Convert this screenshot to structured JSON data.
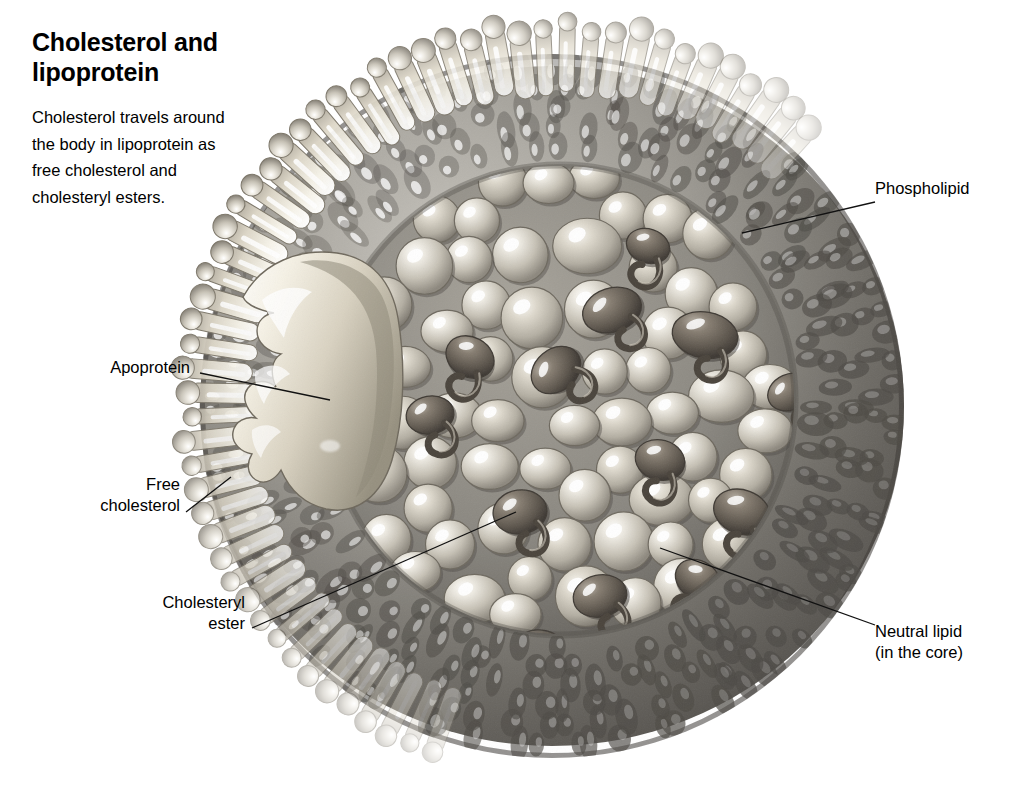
{
  "figure": {
    "title": "Cholesterol\nand lipoprotein",
    "intro": "Cholesterol travels around the body in lipoprotein as free cholesterol and cholesteryl esters.",
    "style": "grayscale-airbrush-illustration",
    "background_color": "#ffffff",
    "ink_color": "#111111"
  },
  "labels": [
    {
      "id": "phospholipid",
      "text": "Phospholipid",
      "side": "right",
      "align": "left",
      "leader_from": [
        875,
        202
      ],
      "leader_to": [
        742,
        233
      ]
    },
    {
      "id": "neutral-lipid",
      "text": "Neutral lipid\n(in the core)",
      "side": "right",
      "align": "left",
      "leader_from": [
        875,
        625
      ],
      "leader_to": [
        660,
        548
      ]
    },
    {
      "id": "apoprotein",
      "text": "Apoprotein",
      "side": "left",
      "align": "right",
      "leader_from": [
        200,
        373
      ],
      "leader_to": [
        330,
        400
      ]
    },
    {
      "id": "free-cholesterol",
      "text": "Free\ncholesterol",
      "side": "left",
      "align": "right",
      "leader_from": [
        186,
        512
      ],
      "leader_to": [
        231,
        477
      ]
    },
    {
      "id": "cholesteryl-ester",
      "text": "Cholesteryl\nester",
      "side": "left",
      "align": "right",
      "leader_from": [
        252,
        628
      ],
      "leader_to": [
        516,
        512
      ]
    }
  ],
  "particle": {
    "center": [
      552,
      406
    ],
    "radius": 352,
    "outer_shell_color": "#6f6f6f",
    "phospholipid_color": "#f2efe6",
    "core_sphere_color": "#cfcabd",
    "cholesteryl_ester_color": "#6b6258",
    "apoprotein_color": "#ded8c8",
    "core_center": [
      560,
      400
    ],
    "core_radius": 232,
    "counts": {
      "phospholipid_molecules": 96,
      "core_spheres": 86,
      "cholesteryl_esters": 14
    }
  }
}
